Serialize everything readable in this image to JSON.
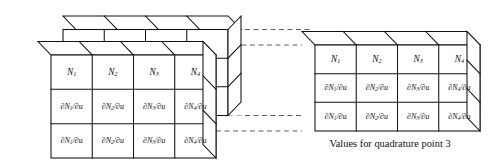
{
  "figure": {
    "caption": "Values for quadrature point 3",
    "background_color": "#ffffff",
    "line_color": "#111111",
    "dashed_line_color": "#555555"
  },
  "grid": {
    "columns": 4,
    "rows": 3,
    "row_labels": [
      [
        "N",
        "1"
      ],
      [
        "N",
        "2"
      ],
      [
        "N",
        "3"
      ],
      [
        "N",
        "4"
      ]
    ]
  },
  "cells": {
    "row1": [
      {
        "base": "N",
        "sub": "1",
        "full": "N1"
      },
      {
        "base": "N",
        "sub": "2",
        "full": "N2"
      },
      {
        "base": "N",
        "sub": "3",
        "full": "N3"
      },
      {
        "base": "N",
        "sub": "4",
        "full": "N4"
      }
    ],
    "row2": [
      {
        "lead": "∂N",
        "sub": "1",
        "tail": "/∂u",
        "full": "∂N1/∂u"
      },
      {
        "lead": "∂N",
        "sub": "2",
        "tail": "/∂u",
        "full": "∂N2/∂u"
      },
      {
        "lead": "∂N",
        "sub": "3",
        "tail": "/∂u",
        "full": "∂N3/∂u"
      },
      {
        "lead": "∂N",
        "sub": "4",
        "tail": "/∂u",
        "full": "∂N4/∂u"
      }
    ],
    "row3": [
      {
        "lead": "∂N",
        "sub": "1",
        "tail": "/∂u",
        "full": "∂N1/∂u"
      },
      {
        "lead": "∂N",
        "sub": "2",
        "tail": "/∂u",
        "full": "∂N2/∂u"
      },
      {
        "lead": "∂N",
        "sub": "3",
        "tail": "/∂u",
        "full": "∂N3/∂u"
      },
      {
        "lead": "∂N",
        "sub": "4",
        "tail": "/∂u",
        "full": "∂N4/∂u"
      }
    ]
  },
  "left_stack": {
    "name": "stacked-quadrature-point-boxes",
    "box_count": 2,
    "description": "Two offset 3D grid boxes representing the full set of quadrature points"
  },
  "right_box": {
    "name": "expanded-quadrature-point-box",
    "description": "Single 3D grid box showing values for quadrature point 3"
  },
  "connectors": {
    "count": 4,
    "style": "dashed"
  }
}
